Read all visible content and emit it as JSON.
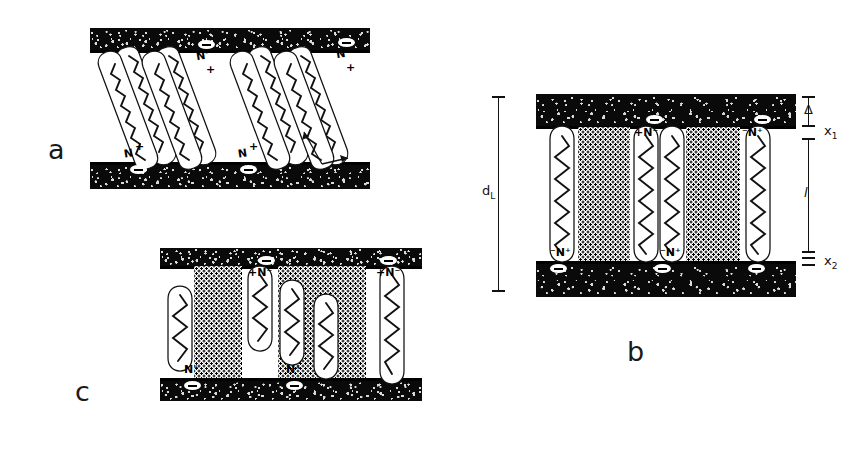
{
  "figure": {
    "background_color": "#ffffff",
    "ink_color": "#111111",
    "width": 866,
    "height": 460,
    "panel_letters": [
      {
        "id": "a",
        "label": "a"
      },
      {
        "id": "b",
        "label": "b"
      },
      {
        "id": "c",
        "label": "c"
      }
    ]
  },
  "panels": {
    "a": {
      "letter": "a",
      "description": "tilted-chain bilayer between two substrates",
      "angle_label": "α",
      "surface_charges": [
        {
          "symbol": "−"
        },
        {
          "symbol": "−"
        },
        {
          "symbol": "−"
        },
        {
          "symbol": "−"
        },
        {
          "symbol": "−"
        }
      ],
      "headgroups": [
        {
          "label": "N⁻",
          "position": "top"
        },
        {
          "label": "+",
          "position": "top"
        },
        {
          "label": "N⁻",
          "position": "top"
        },
        {
          "label": "+",
          "position": "top"
        },
        {
          "label": "N",
          "position": "bottom"
        },
        {
          "label": "+",
          "position": "bottom"
        },
        {
          "label": "N",
          "position": "bottom"
        },
        {
          "label": "+",
          "position": "bottom"
        }
      ],
      "chain_count": 8,
      "tilt_degrees": 20
    },
    "b": {
      "letter": "b",
      "description": "vertical fully extended chains with stippled gap regions",
      "dimensions": [
        {
          "name": "d_L",
          "label": "d",
          "sub": "L",
          "side": "left"
        },
        {
          "name": "delta",
          "label": "Δ",
          "sub": "",
          "side": "right"
        },
        {
          "name": "x1",
          "label": "x",
          "sub": "1",
          "side": "right"
        },
        {
          "name": "l",
          "label": "l",
          "sub": "",
          "side": "right"
        },
        {
          "name": "x2",
          "label": "x",
          "sub": "2",
          "side": "right"
        }
      ],
      "headgroups": [
        {
          "label": "+N⁻",
          "position": "top"
        },
        {
          "label": "⁻N⁺",
          "position": "top"
        },
        {
          "label": "⁻N⁺",
          "position": "bottom"
        },
        {
          "label": "⁻N⁺",
          "position": "bottom"
        }
      ],
      "chain_count": 6,
      "stipple_blocks": 2,
      "surface_charges": [
        {
          "symbol": "−"
        },
        {
          "symbol": "−"
        },
        {
          "symbol": "−"
        },
        {
          "symbol": "−"
        },
        {
          "symbol": "−"
        }
      ]
    },
    "c": {
      "letter": "c",
      "description": "mixed length and folded chains, partly filled gap",
      "headgroups": [
        {
          "label": "+N⁻",
          "position": "top"
        },
        {
          "label": "+N⁻",
          "position": "top"
        },
        {
          "label": "N⁺",
          "position": "bottom"
        },
        {
          "label": "N⁺",
          "position": "bottom"
        }
      ],
      "chain_count": 5,
      "stipple_blocks": 2,
      "surface_charges": [
        {
          "symbol": "−"
        },
        {
          "symbol": "−"
        },
        {
          "symbol": "−"
        },
        {
          "symbol": "−"
        }
      ]
    }
  }
}
